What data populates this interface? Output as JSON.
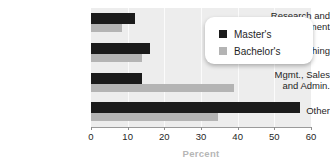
{
  "chart_data": {
    "type": "bar",
    "orientation": "horizontal",
    "title": "",
    "xlabel": "Percent",
    "ylabel": "",
    "xlim": [
      0,
      60
    ],
    "xticks": [
      0,
      10,
      20,
      30,
      40,
      50,
      60
    ],
    "xtick_labels": [
      "0",
      "10",
      "20",
      "30",
      "40",
      "50",
      "60"
    ],
    "grid": true,
    "legend_position": "top-right",
    "categories": [
      "Research and Development",
      "Teaching",
      "Mgmt., Sales and Admin.",
      "Other"
    ],
    "category_lines": [
      [
        "Research and",
        "Development"
      ],
      [
        "Teaching"
      ],
      [
        "Mgmt., Sales",
        "and Admin."
      ],
      [
        "Other"
      ]
    ],
    "series": [
      {
        "name": "Master's",
        "color": "#1b1b1b",
        "values": [
          12,
          16,
          14,
          57
        ]
      },
      {
        "name": "Bachelor's",
        "color": "#b4b4b4",
        "values": [
          8.5,
          14,
          39,
          34.5
        ]
      }
    ]
  },
  "legend": {
    "entries": [
      {
        "label": "Master's",
        "swatch": "legend-swatch-masters",
        "color": "#1b1b1b"
      },
      {
        "label": "Bachelor's",
        "swatch": "legend-swatch-bachelors",
        "color": "#b4b4b4"
      }
    ]
  },
  "colors": {
    "plot_background": "#ededed",
    "gridline": "#fbfbfb",
    "axis_line": "#9a9a9a",
    "tick_text": "#1f1f1f",
    "axis_title": "#b6b6b6",
    "legend_background": "#ffffff"
  }
}
